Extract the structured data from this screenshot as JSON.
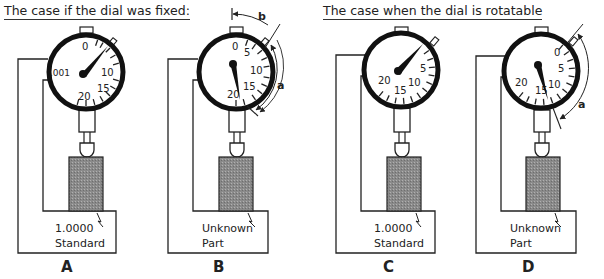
{
  "headings": {
    "fixed": "The case if the dial was fixed:",
    "rotatable": "The case when the dial is rotatable"
  },
  "panels": [
    {
      "letter": "A",
      "base_line1": "1.0000",
      "base_line2": "Standard",
      "dial_labels": [
        "0",
        "10",
        "15",
        "20",
        ".001"
      ]
    },
    {
      "letter": "B",
      "base_line1": "Unknown",
      "base_line2": "Part",
      "dial_labels": [
        "0",
        "5",
        "10",
        "15",
        "20"
      ],
      "arc_labels": [
        "b",
        "a"
      ]
    },
    {
      "letter": "C",
      "base_line1": "1.0000",
      "base_line2": "Standard",
      "dial_labels": [
        "5",
        "10",
        "15",
        "20"
      ]
    },
    {
      "letter": "D",
      "base_line1": "Unknown",
      "base_line2": "Part",
      "dial_labels": [
        "0",
        "5",
        "10",
        "15",
        "20"
      ],
      "arc_labels": [
        "a"
      ]
    }
  ]
}
